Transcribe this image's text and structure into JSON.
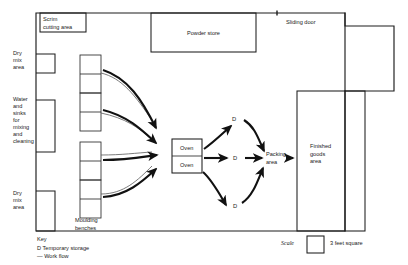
{
  "diagram": {
    "rooms": {
      "scrim_cutting_area": "Scrim\ncutting area",
      "scrim_cutting_line1": "Scrim",
      "scrim_cutting_line2": "cutting area",
      "powder_store": "Powder store",
      "sliding_door": "Sliding door",
      "finished_goods_line1": "Finished",
      "finished_goods_line2": "goods",
      "finished_goods_line3": "area",
      "packing_line1": "Packing",
      "packing_line2": "area",
      "oven_upper": "Oven",
      "oven_lower": "Oven"
    },
    "left_wall_alcoves": [
      {
        "line1": "Dry",
        "line2": "mix",
        "line3": "area"
      },
      {
        "line1": "Water",
        "line2": "and",
        "line3": "sinks",
        "line4": "for",
        "line5": "mixing",
        "line6": "and",
        "line7": "cleaning"
      },
      {
        "line1": "Dry",
        "line2": "mix",
        "line3": "area"
      }
    ],
    "benches": {
      "label_line1": "Moulding",
      "label_line2": "benches",
      "count": 4
    },
    "storage_markers": [
      {
        "label": "D",
        "position": "upper"
      },
      {
        "label": "D",
        "position": "middle"
      },
      {
        "label": "D",
        "position": "lower"
      }
    ],
    "key": {
      "heading": "Key",
      "entry_storage": "D Temporary storage",
      "entry_flow": "— Work flow"
    },
    "scale": {
      "label": "Scale",
      "caption": "3 feet square"
    },
    "colors": {
      "wall": "#1d1d1d",
      "flow_thick": "#111111",
      "flow_thin": "#5a5a5a",
      "text": "#1a1a1a",
      "background": "#ffffff"
    }
  }
}
